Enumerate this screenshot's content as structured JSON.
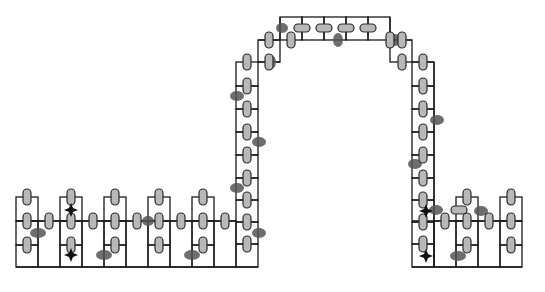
{
  "diagram": {
    "width": 545,
    "height": 292,
    "colors": {
      "stroke": "#1a1a1a",
      "qubit_fill": "#b8b8b8",
      "defect_fill": "#555555",
      "marker_fill": "#111111",
      "background": "#ffffff"
    },
    "cells": [
      [
        16,
        197,
        22,
        24
      ],
      [
        16,
        221,
        22,
        24
      ],
      [
        16,
        245,
        22,
        22
      ],
      [
        38,
        221,
        22,
        46
      ],
      [
        60,
        197,
        22,
        24
      ],
      [
        60,
        221,
        22,
        24
      ],
      [
        60,
        245,
        22,
        22
      ],
      [
        82,
        221,
        22,
        46
      ],
      [
        104,
        197,
        22,
        24
      ],
      [
        104,
        221,
        22,
        24
      ],
      [
        104,
        245,
        22,
        22
      ],
      [
        126,
        221,
        22,
        46
      ],
      [
        148,
        197,
        22,
        24
      ],
      [
        148,
        221,
        22,
        24
      ],
      [
        148,
        245,
        22,
        22
      ],
      [
        170,
        221,
        22,
        46
      ],
      [
        192,
        197,
        22,
        24
      ],
      [
        192,
        221,
        22,
        24
      ],
      [
        192,
        245,
        22,
        22
      ],
      [
        214,
        221,
        22,
        46
      ],
      [
        236,
        62,
        22,
        24
      ],
      [
        236,
        86,
        22,
        23
      ],
      [
        236,
        109,
        22,
        23
      ],
      [
        236,
        132,
        22,
        23
      ],
      [
        236,
        155,
        22,
        23
      ],
      [
        236,
        178,
        22,
        22
      ],
      [
        236,
        200,
        22,
        22
      ],
      [
        236,
        222,
        22,
        22
      ],
      [
        236,
        244,
        22,
        23
      ],
      [
        258,
        62,
        0,
        0
      ],
      [
        258,
        40,
        22,
        22
      ],
      [
        280,
        17,
        22,
        23
      ],
      [
        302,
        17,
        22,
        23
      ],
      [
        324,
        17,
        22,
        23
      ],
      [
        346,
        17,
        22,
        23
      ],
      [
        368,
        17,
        22,
        23
      ],
      [
        390,
        40,
        22,
        22
      ],
      [
        412,
        62,
        22,
        24
      ],
      [
        412,
        86,
        22,
        23
      ],
      [
        412,
        109,
        22,
        23
      ],
      [
        412,
        132,
        22,
        23
      ],
      [
        412,
        155,
        22,
        23
      ],
      [
        412,
        178,
        22,
        22
      ],
      [
        412,
        200,
        22,
        22
      ],
      [
        412,
        222,
        22,
        22
      ],
      [
        412,
        244,
        22,
        23
      ],
      [
        434,
        221,
        22,
        46
      ],
      [
        456,
        197,
        22,
        24
      ],
      [
        456,
        221,
        22,
        24
      ],
      [
        456,
        245,
        22,
        22
      ],
      [
        478,
        221,
        22,
        46
      ],
      [
        500,
        197,
        22,
        24
      ],
      [
        500,
        221,
        22,
        24
      ],
      [
        500,
        245,
        22,
        22
      ]
    ],
    "lines": [
      [
        16,
        221,
        236,
        221
      ],
      [
        16,
        267,
        258,
        267
      ],
      [
        258,
        62,
        280,
        62
      ],
      [
        258,
        40,
        280,
        40
      ],
      [
        280,
        17,
        280,
        40
      ],
      [
        390,
        17,
        390,
        40
      ],
      [
        390,
        40,
        412,
        40
      ],
      [
        412,
        62,
        434,
        62
      ],
      [
        434,
        62,
        434,
        267
      ],
      [
        412,
        221,
        522,
        221
      ],
      [
        412,
        267,
        522,
        267
      ]
    ],
    "qubits_vertical": [
      [
        27,
        197
      ],
      [
        27,
        221
      ],
      [
        27,
        245
      ],
      [
        71,
        197
      ],
      [
        71,
        221
      ],
      [
        71,
        245
      ],
      [
        115,
        197
      ],
      [
        115,
        221
      ],
      [
        115,
        245
      ],
      [
        159,
        197
      ],
      [
        159,
        221
      ],
      [
        159,
        245
      ],
      [
        203,
        197
      ],
      [
        203,
        221
      ],
      [
        203,
        245
      ],
      [
        247,
        62
      ],
      [
        247,
        86
      ],
      [
        247,
        109
      ],
      [
        247,
        132
      ],
      [
        247,
        155
      ],
      [
        247,
        178
      ],
      [
        247,
        200
      ],
      [
        247,
        222
      ],
      [
        247,
        244
      ],
      [
        269,
        40
      ],
      [
        269,
        62
      ],
      [
        291,
        40
      ],
      [
        390,
        40
      ],
      [
        402,
        40
      ],
      [
        402,
        62
      ],
      [
        423,
        62
      ],
      [
        423,
        86
      ],
      [
        423,
        109
      ],
      [
        423,
        132
      ],
      [
        423,
        155
      ],
      [
        423,
        178
      ],
      [
        423,
        200
      ],
      [
        423,
        222
      ],
      [
        423,
        244
      ],
      [
        467,
        197
      ],
      [
        467,
        221
      ],
      [
        467,
        245
      ],
      [
        489,
        221
      ],
      [
        511,
        197
      ],
      [
        511,
        221
      ],
      [
        511,
        245
      ],
      [
        49,
        221
      ],
      [
        93,
        221
      ],
      [
        137,
        221
      ],
      [
        181,
        221
      ],
      [
        225,
        221
      ],
      [
        445,
        221
      ]
    ],
    "qubits_horizontal": [
      [
        302,
        28
      ],
      [
        324,
        28
      ],
      [
        346,
        28
      ],
      [
        368,
        28
      ],
      [
        459,
        210
      ]
    ],
    "defects": [
      [
        38,
        233,
        8,
        5
      ],
      [
        104,
        255,
        8,
        5
      ],
      [
        148,
        221,
        6,
        5
      ],
      [
        192,
        255,
        8,
        5
      ],
      [
        237,
        96,
        7,
        5
      ],
      [
        259,
        142,
        7,
        5
      ],
      [
        237,
        188,
        7,
        5
      ],
      [
        259,
        233,
        7,
        5
      ],
      [
        271,
        62,
        5,
        7
      ],
      [
        282,
        28,
        6,
        5
      ],
      [
        338,
        40,
        5,
        7
      ],
      [
        395,
        40,
        6,
        6
      ],
      [
        437,
        120,
        7,
        5
      ],
      [
        415,
        164,
        7,
        5
      ],
      [
        436,
        210,
        7,
        5
      ],
      [
        481,
        211,
        7,
        5
      ],
      [
        458,
        256,
        8,
        5
      ]
    ],
    "markers": [
      [
        71,
        210
      ],
      [
        71,
        255
      ],
      [
        426,
        211
      ],
      [
        426,
        256
      ]
    ]
  }
}
